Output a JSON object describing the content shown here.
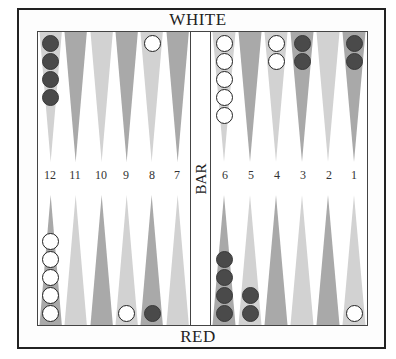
{
  "labels": {
    "top_player": "WHITE",
    "bottom_player": "RED",
    "bar": "BAR"
  },
  "colors": {
    "dark_point": "#a9a9a9",
    "light_point": "#d2d2d2",
    "red_checker": "#4a4a4a",
    "white_checker": "#ffffff",
    "border": "#222222"
  },
  "point_numbers": {
    "left_top": [
      "12",
      "11",
      "10",
      "9",
      "8",
      "7"
    ],
    "right_top": [
      "6",
      "5",
      "4",
      "3",
      "2",
      "1"
    ]
  },
  "position": {
    "top": [
      {
        "point": "12",
        "shade": "light",
        "checkers": {
          "color": "red",
          "count": 4
        }
      },
      {
        "point": "11",
        "shade": "dark",
        "checkers": null
      },
      {
        "point": "10",
        "shade": "light",
        "checkers": null
      },
      {
        "point": "9",
        "shade": "dark",
        "checkers": null
      },
      {
        "point": "8",
        "shade": "light",
        "checkers": {
          "color": "white",
          "count": 1
        }
      },
      {
        "point": "7",
        "shade": "dark",
        "checkers": null
      },
      {
        "point": "6",
        "shade": "light",
        "checkers": {
          "color": "white",
          "count": 5
        }
      },
      {
        "point": "5",
        "shade": "dark",
        "checkers": null
      },
      {
        "point": "4",
        "shade": "light",
        "checkers": {
          "color": "white",
          "count": 2
        }
      },
      {
        "point": "3",
        "shade": "dark",
        "checkers": {
          "color": "red",
          "count": 2
        }
      },
      {
        "point": "2",
        "shade": "light",
        "checkers": null
      },
      {
        "point": "1",
        "shade": "dark",
        "checkers": {
          "color": "red",
          "count": 2
        }
      }
    ],
    "bottom": [
      {
        "index": 1,
        "shade": "dark",
        "checkers": {
          "color": "white",
          "count": 5
        }
      },
      {
        "index": 2,
        "shade": "light",
        "checkers": null
      },
      {
        "index": 3,
        "shade": "dark",
        "checkers": null
      },
      {
        "index": 4,
        "shade": "light",
        "checkers": {
          "color": "white",
          "count": 1
        }
      },
      {
        "index": 5,
        "shade": "dark",
        "checkers": {
          "color": "red",
          "count": 1
        }
      },
      {
        "index": 6,
        "shade": "light",
        "checkers": null
      },
      {
        "index": 7,
        "shade": "dark",
        "checkers": {
          "color": "red",
          "count": 4
        }
      },
      {
        "index": 8,
        "shade": "light",
        "checkers": {
          "color": "red",
          "count": 2
        }
      },
      {
        "index": 9,
        "shade": "dark",
        "checkers": null
      },
      {
        "index": 10,
        "shade": "light",
        "checkers": null
      },
      {
        "index": 11,
        "shade": "dark",
        "checkers": null
      },
      {
        "index": 12,
        "shade": "light",
        "checkers": {
          "color": "white",
          "count": 1
        }
      }
    ]
  }
}
